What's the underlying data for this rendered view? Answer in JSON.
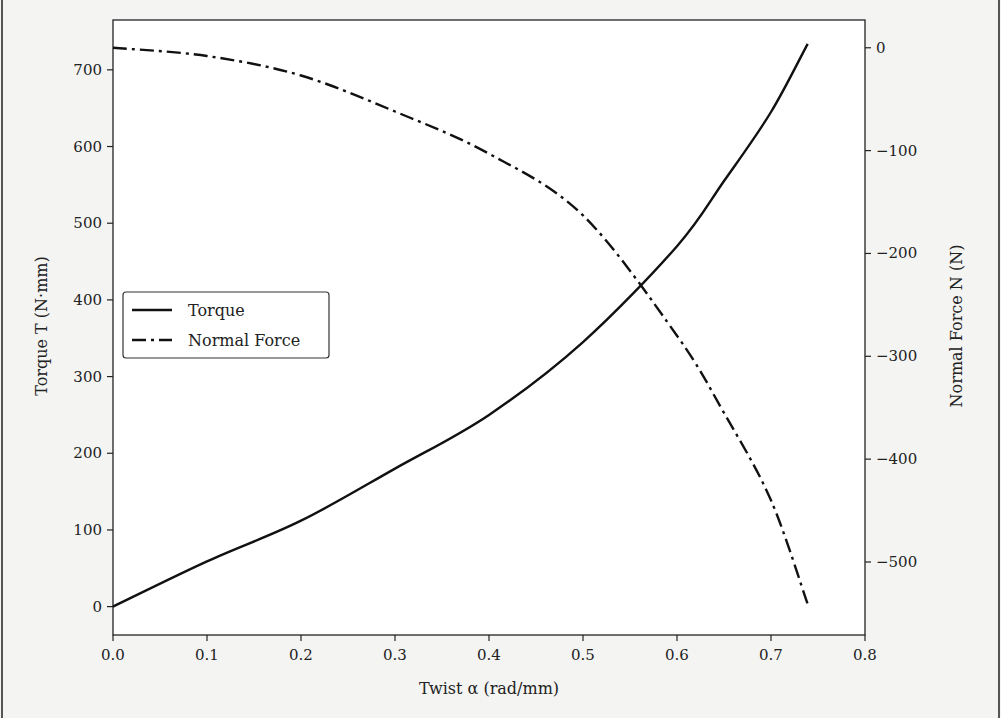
{
  "chart_data": {
    "type": "line",
    "title": "",
    "xlabel": "Twist α (rad/mm)",
    "ylabel": "Torque T (N·mm)",
    "y2label": "Normal Force  N (N)",
    "xlim": [
      0.0,
      0.8
    ],
    "ylim": [
      -37,
      765
    ],
    "y2lim": [
      -571,
      27
    ],
    "xticks": [
      "0.0",
      "0.1",
      "0.2",
      "0.3",
      "0.4",
      "0.5",
      "0.6",
      "0.7",
      "0.8"
    ],
    "yticks": [
      "0",
      "100",
      "200",
      "300",
      "400",
      "500",
      "600",
      "700"
    ],
    "y2ticks": [
      "0",
      "−100",
      "−200",
      "−300",
      "−400",
      "−500"
    ],
    "grid": false,
    "legend_position": "center left",
    "x": [
      0.0,
      0.1,
      0.2,
      0.3,
      0.4,
      0.5,
      0.6,
      0.65,
      0.7,
      0.739
    ],
    "series": [
      {
        "name": "Torque",
        "axis": "left",
        "style": "solid",
        "values": [
          0,
          59,
          112,
          180,
          250,
          345,
          470,
          555,
          645,
          734
        ]
      },
      {
        "name": "Normal Force",
        "axis": "right",
        "style": "dashdot",
        "values": [
          0,
          -8,
          -27,
          -62,
          -103,
          -163,
          -280,
          -355,
          -440,
          -541
        ]
      }
    ]
  },
  "legend": {
    "items": [
      {
        "label": "Torque",
        "style": "solid"
      },
      {
        "label": "Normal Force",
        "style": "dashdot"
      }
    ]
  },
  "colors": {
    "line": "#111111",
    "axis": "#222222",
    "background": "#f4f4f3"
  }
}
